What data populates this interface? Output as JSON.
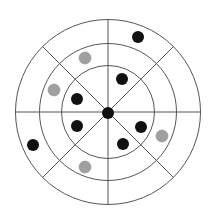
{
  "diagram": {
    "rings": 3,
    "sectors": 8,
    "colors": {
      "line": "#555555",
      "black_dot": "#111111",
      "gray_dot": "#a0a0a0",
      "center_dot": "#111111"
    },
    "center_dot": {
      "color": "black"
    },
    "dots": [
      {
        "color": "black",
        "ring": 3,
        "sector_angle_deg": 67
      },
      {
        "color": "gray",
        "ring": 2,
        "sector_angle_deg": 112
      },
      {
        "color": "black",
        "ring": 1,
        "sector_angle_deg": 65
      },
      {
        "color": "gray",
        "ring": 2,
        "sector_angle_deg": 152
      },
      {
        "color": "black",
        "ring": 1,
        "sector_angle_deg": 146
      },
      {
        "color": "black",
        "ring": 1,
        "sector_angle_deg": 210
      },
      {
        "color": "black",
        "ring": 1,
        "sector_angle_deg": 337
      },
      {
        "color": "gray",
        "ring": 2,
        "sector_angle_deg": 337
      },
      {
        "color": "black",
        "ring": 3,
        "sector_angle_deg": 202
      },
      {
        "color": "black",
        "ring": 1,
        "sector_angle_deg": 299
      },
      {
        "color": "gray",
        "ring": 2,
        "sector_angle_deg": 241
      }
    ]
  }
}
